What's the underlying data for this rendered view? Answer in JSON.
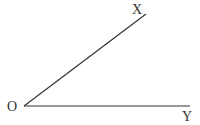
{
  "diagram": {
    "type": "angle",
    "vertex": {
      "label": "O",
      "x": 24,
      "y": 106
    },
    "rays": [
      {
        "label": "X",
        "x": 146,
        "y": 14
      },
      {
        "label": "Y",
        "x": 190,
        "y": 106
      }
    ],
    "stroke_color": "#333333"
  }
}
